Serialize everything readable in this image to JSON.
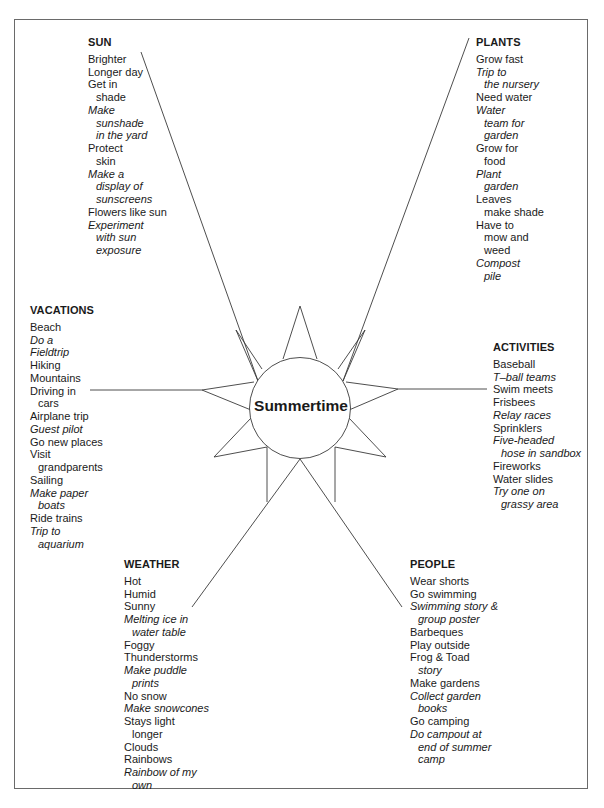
{
  "title": "Summertime",
  "groups": {
    "sun": {
      "heading": "SUN",
      "items": [
        {
          "lines": [
            "Brighter"
          ],
          "italic": false
        },
        {
          "lines": [
            "Longer day"
          ],
          "italic": false
        },
        {
          "lines": [
            "Get in",
            "shade"
          ],
          "italic": false
        },
        {
          "lines": [
            "Make",
            "sunshade",
            "in the yard"
          ],
          "italic": true
        },
        {
          "lines": [
            "Protect",
            "skin"
          ],
          "italic": false
        },
        {
          "lines": [
            "Make a",
            "display of",
            "sunscreens"
          ],
          "italic": true
        },
        {
          "lines": [
            "Flowers like sun"
          ],
          "italic": false
        },
        {
          "lines": [
            "Experiment",
            "with sun",
            "exposure"
          ],
          "italic": true
        }
      ]
    },
    "plants": {
      "heading": "PLANTS",
      "items": [
        {
          "lines": [
            "Grow fast"
          ],
          "italic": false
        },
        {
          "lines": [
            "Trip to",
            "the nursery"
          ],
          "italic": true
        },
        {
          "lines": [
            "Need water"
          ],
          "italic": false
        },
        {
          "lines": [
            "Water",
            "team for",
            "garden"
          ],
          "italic": true
        },
        {
          "lines": [
            "Grow for",
            "food"
          ],
          "italic": false
        },
        {
          "lines": [
            "Plant",
            "garden"
          ],
          "italic": true
        },
        {
          "lines": [
            "Leaves",
            "make shade"
          ],
          "italic": false
        },
        {
          "lines": [
            "Have to",
            "mow and",
            "weed"
          ],
          "italic": false
        },
        {
          "lines": [
            "Compost",
            "pile"
          ],
          "italic": true
        }
      ]
    },
    "vacations": {
      "heading": "VACATIONS",
      "items": [
        {
          "lines": [
            "Beach"
          ],
          "italic": false
        },
        {
          "lines": [
            "Do a"
          ],
          "italic": true
        },
        {
          "lines": [
            "Fieldtrip"
          ],
          "italic": true
        },
        {
          "lines": [
            "Hiking"
          ],
          "italic": false
        },
        {
          "lines": [
            "Mountains"
          ],
          "italic": false
        },
        {
          "lines": [
            "Driving in",
            "cars"
          ],
          "italic": false
        },
        {
          "lines": [
            "Airplane trip"
          ],
          "italic": false
        },
        {
          "lines": [
            "Guest pilot"
          ],
          "italic": true
        },
        {
          "lines": [
            "Go new places"
          ],
          "italic": false
        },
        {
          "lines": [
            "Visit",
            "grandparents"
          ],
          "italic": false
        },
        {
          "lines": [
            "Sailing"
          ],
          "italic": false
        },
        {
          "lines": [
            "Make paper",
            "boats"
          ],
          "italic": true
        },
        {
          "lines": [
            "Ride trains"
          ],
          "italic": false
        },
        {
          "lines": [
            "Trip to",
            "aquarium"
          ],
          "italic": true
        }
      ]
    },
    "activities": {
      "heading": "ACTIVITIES",
      "items": [
        {
          "lines": [
            "Baseball"
          ],
          "italic": false
        },
        {
          "lines": [
            "T–ball teams"
          ],
          "italic": true
        },
        {
          "lines": [
            "Swim meets"
          ],
          "italic": false
        },
        {
          "lines": [
            "Frisbees"
          ],
          "italic": false
        },
        {
          "lines": [
            "Relay races"
          ],
          "italic": true
        },
        {
          "lines": [
            "Sprinklers"
          ],
          "italic": false
        },
        {
          "lines": [
            "Five-headed",
            "hose in sandbox"
          ],
          "italic": true
        },
        {
          "lines": [
            "Fireworks"
          ],
          "italic": false
        },
        {
          "lines": [
            "Water slides"
          ],
          "italic": false
        },
        {
          "lines": [
            "Try one on",
            "grassy area"
          ],
          "italic": true
        }
      ]
    },
    "weather": {
      "heading": "WEATHER",
      "items": [
        {
          "lines": [
            "Hot"
          ],
          "italic": false
        },
        {
          "lines": [
            "Humid"
          ],
          "italic": false
        },
        {
          "lines": [
            "Sunny"
          ],
          "italic": false
        },
        {
          "lines": [
            "Melting ice in",
            "water table"
          ],
          "italic": true
        },
        {
          "lines": [
            "Foggy"
          ],
          "italic": false
        },
        {
          "lines": [
            "Thunderstorms"
          ],
          "italic": false
        },
        {
          "lines": [
            "Make puddle",
            "prints"
          ],
          "italic": true
        },
        {
          "lines": [
            "No snow"
          ],
          "italic": false
        },
        {
          "lines": [
            "Make snowcones"
          ],
          "italic": true
        },
        {
          "lines": [
            "Stays light",
            "longer"
          ],
          "italic": false
        },
        {
          "lines": [
            "Clouds"
          ],
          "italic": false
        },
        {
          "lines": [
            "Rainbows"
          ],
          "italic": false
        },
        {
          "lines": [
            "Rainbow of my",
            "own"
          ],
          "italic": true
        }
      ]
    },
    "people": {
      "heading": "PEOPLE",
      "items": [
        {
          "lines": [
            "Wear shorts"
          ],
          "italic": false
        },
        {
          "lines": [
            "Go swimming"
          ],
          "italic": false
        },
        {
          "lines": [
            "Swimming story &",
            "group poster"
          ],
          "italic": true
        },
        {
          "lines": [
            "Barbeques"
          ],
          "italic": false
        },
        {
          "lines": [
            "Play outside"
          ],
          "italic": false
        },
        {
          "lines": [
            "Frog & Toad",
            "story"
          ],
          "italic": false,
          "cont_italic": true
        },
        {
          "lines": [
            "Make gardens"
          ],
          "italic": false
        },
        {
          "lines": [
            "Collect garden",
            "books"
          ],
          "italic": true
        },
        {
          "lines": [
            "Go camping"
          ],
          "italic": false
        },
        {
          "lines": [
            "Do campout at",
            "end of summer",
            "camp"
          ],
          "italic": true
        }
      ]
    }
  },
  "colors": {
    "line": "#3a3a3a",
    "frame": "#6a6a6a",
    "text": "#1a1a1a"
  }
}
